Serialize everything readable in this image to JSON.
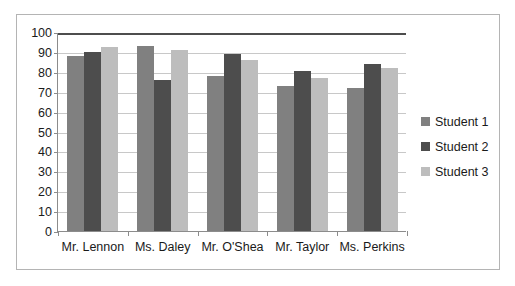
{
  "chart_data": {
    "type": "bar",
    "title": "",
    "xlabel": "",
    "ylabel": "",
    "ylim": [
      0,
      100
    ],
    "ytick_step": 10,
    "yticks": [
      100,
      90,
      80,
      70,
      60,
      50,
      40,
      30,
      20,
      10,
      0
    ],
    "grid": true,
    "legend_position": "right",
    "categories": [
      "Mr. Lennon",
      "Ms. Daley",
      "Mr. O'Shea",
      "Mr. Taylor",
      "Ms. Perkins"
    ],
    "series": [
      {
        "name": "Student 1",
        "color": "#808080",
        "values": [
          88,
          93,
          78,
          73,
          72
        ]
      },
      {
        "name": "Student 2",
        "color": "#4d4d4d",
        "values": [
          90,
          76,
          89,
          80.5,
          84
        ]
      },
      {
        "name": "Student 3",
        "color": "#bdbdbd",
        "values": [
          92.5,
          91,
          86,
          77,
          82
        ]
      }
    ]
  },
  "legend": {
    "entries": [
      {
        "label": "Student 1"
      },
      {
        "label": "Student 2"
      },
      {
        "label": "Student 3"
      }
    ]
  }
}
